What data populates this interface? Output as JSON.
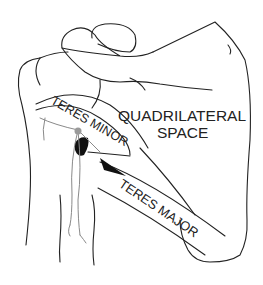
{
  "diagram": {
    "labels": {
      "quadrilateral_space_line1": "QUADRILATERAL",
      "quadrilateral_space_line2": "SPACE",
      "teres_minor": "TERES MINOR",
      "teres_major": "TERES MAJOR"
    },
    "colors": {
      "outline": "#222222",
      "nerve": "#8a8a8a",
      "nerve_dot": "#9a9a9a",
      "vessel_fill": "#111111",
      "background": "#ffffff"
    }
  }
}
